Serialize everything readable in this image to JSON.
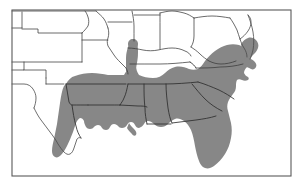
{
  "figure": {
    "type": "range-distribution-map",
    "region": "Southeastern United States",
    "title": "",
    "caption": "",
    "background_color": "#ffffff",
    "frame": {
      "visible": true,
      "color": "#5a5a5a",
      "x": 12,
      "y": 10,
      "width": 279,
      "height": 166
    }
  },
  "legend": {
    "visible": false,
    "entries": [
      {
        "label": "Shaded distribution range",
        "color": "#878787",
        "swatch": "solid-gray-fill"
      },
      {
        "label": "Outside range",
        "color": "#ffffff",
        "swatch": "white-fill"
      }
    ]
  },
  "styles": {
    "range_fill": "#878787",
    "state_boundary": "#3a3a3a",
    "coastline": "#4a4a4a",
    "range_edge": "#2e2e2e",
    "frame_stroke": "#5a5a5a"
  },
  "map_content": {
    "shaded_states_full": [
      "Florida",
      "Georgia",
      "South Carolina",
      "Alabama",
      "Mississippi",
      "Louisiana",
      "Arkansas"
    ],
    "shaded_states_partial": [
      "Texas (eastern)",
      "Oklahoma (eastern)",
      "Missouri (southern)",
      "Tennessee (western and central)",
      "North Carolina (eastern)",
      "Virginia (southeastern)",
      "Maryland (eastern shore)",
      "Kentucky (western tip)",
      "Illinois (southern tip)"
    ],
    "unshaded_states": [
      "Colorado",
      "Kansas",
      "Nebraska",
      "Iowa",
      "Illinois (northern)",
      "Indiana",
      "Ohio",
      "West Virginia",
      "Pennsylvania",
      "New Jersey",
      "Delaware",
      "Kentucky (eastern)",
      "Tennessee (eastern mountains)",
      "Texas (western)",
      "Oklahoma (western)",
      "New Mexico (eastern edge)",
      "Missouri (northern)"
    ],
    "features": [
      "Gulf of Mexico coastline",
      "Atlantic coastline",
      "Mississippi River delta",
      "Chesapeake Bay",
      "Delmarva Peninsula",
      "Outer Banks",
      "Florida Peninsula",
      "Oklahoma Panhandle"
    ]
  },
  "labels": {
    "visible_text": []
  }
}
